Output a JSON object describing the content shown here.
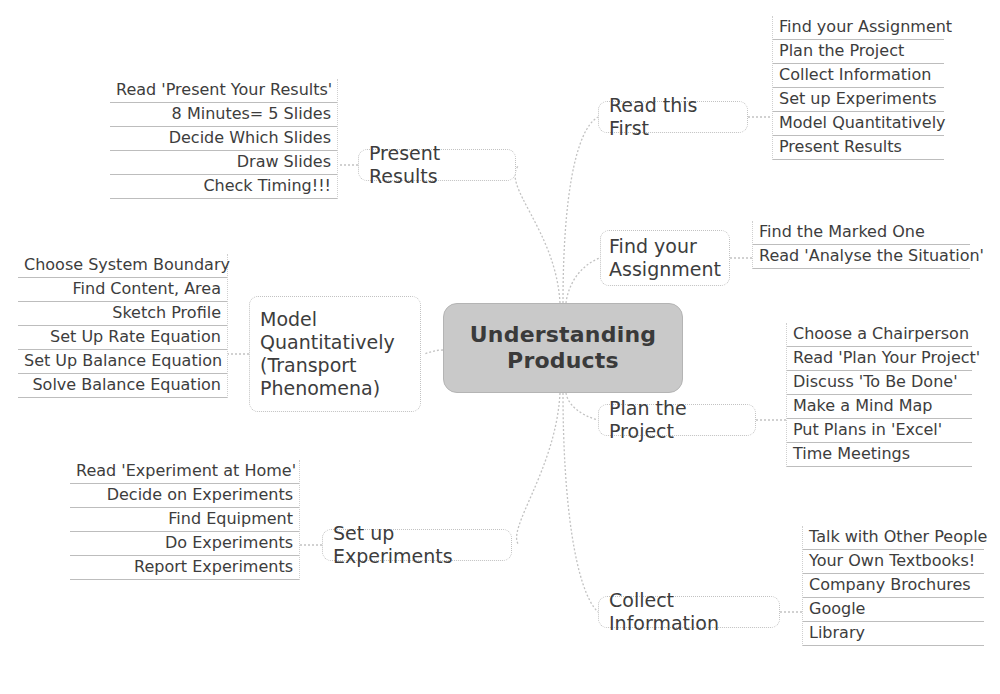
{
  "diagram": {
    "type": "mind-map",
    "title": "Understanding Products",
    "center": {
      "label": "Understanding\nProducts",
      "fill_color": "#c9c9c9",
      "text_color": "#3a3a3a"
    },
    "link_color": "#c2c2c2",
    "leaf_underline_color": "#bdbdbd",
    "background_color": "#ffffff",
    "branches": [
      {
        "id": "read-this-first",
        "label": "Read this First",
        "side": "right",
        "leaves": [
          "Find your Assignment",
          "Plan the Project",
          "Collect Information",
          "Set up Experiments",
          "Model Quantitatively",
          "Present Results"
        ]
      },
      {
        "id": "find-your-assignment",
        "label": "Find your\nAssignment",
        "side": "right",
        "leaves": [
          "Find the Marked One",
          "Read 'Analyse the Situation'"
        ]
      },
      {
        "id": "plan-the-project",
        "label": "Plan the Project",
        "side": "right",
        "leaves": [
          "Choose a Chairperson",
          "Read 'Plan Your Project'",
          "Discuss 'To Be Done'",
          "Make a Mind Map",
          "Put Plans in 'Excel'",
          "Time Meetings"
        ]
      },
      {
        "id": "collect-information",
        "label": "Collect Information",
        "side": "right",
        "leaves": [
          "Talk with Other People",
          "Your Own Textbooks!",
          "Company Brochures",
          "Google",
          "Library"
        ]
      },
      {
        "id": "present-results",
        "label": "Present Results",
        "side": "left",
        "leaves": [
          "Read 'Present Your Results'",
          "8 Minutes= 5 Slides",
          "Decide Which Slides",
          "Draw Slides",
          "Check Timing!!!"
        ]
      },
      {
        "id": "model-quantitatively",
        "label": "Model\nQuantitatively\n(Transport\nPhenomena)",
        "side": "left",
        "leaves": [
          "Choose System Boundary",
          "Find Content, Area",
          "Sketch Profile",
          "Set Up Rate Equation",
          "Set Up Balance Equation",
          "Solve Balance Equation"
        ]
      },
      {
        "id": "set-up-experiments",
        "label": "Set up Experiments",
        "side": "left",
        "leaves": [
          "Read 'Experiment at Home'",
          "Decide on Experiments",
          "Find Equipment",
          "Do Experiments",
          "Report Experiments"
        ]
      }
    ],
    "bottom_caption": ""
  }
}
